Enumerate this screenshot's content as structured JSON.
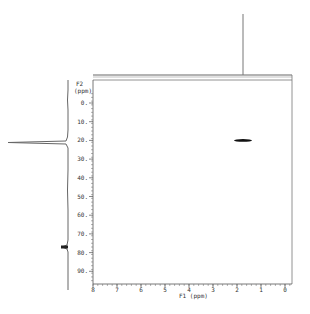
{
  "chart_data": {
    "type": "heatmap",
    "subtype": "2D NMR contour plot (HSQC-like) with 1D projections",
    "xlabel": "F1 (ppm)",
    "ylabel": "F2 (ppm)",
    "xlim": [
      8,
      0
    ],
    "ylim": [
      -5,
      95
    ],
    "x_ticks": [
      8,
      7,
      6,
      5,
      4,
      3,
      2,
      1,
      0
    ],
    "y_ticks": [
      0,
      10,
      20,
      30,
      40,
      50,
      60,
      70,
      80,
      90
    ],
    "y_tick_labels": [
      "0.",
      "10.",
      "20.",
      "30.",
      "40.",
      "50.",
      "60.",
      "70.",
      "80.",
      "90."
    ],
    "grid": false,
    "cross_peaks": [
      {
        "f1_ppm": 1.75,
        "f2_ppm": 20
      }
    ],
    "top_projection": {
      "peaks": [
        {
          "ppm": 1.75,
          "relative_intensity": 1.0
        }
      ]
    },
    "left_projection": {
      "peaks": [
        {
          "ppm": 20,
          "relative_intensity": 1.0
        },
        {
          "ppm": 77,
          "relative_intensity": 0.1
        }
      ]
    }
  },
  "colors": {
    "line": "#555555",
    "peak": "#111111",
    "frame": "#777777"
  }
}
